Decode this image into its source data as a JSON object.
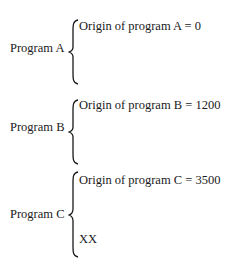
{
  "programs": [
    {
      "label": "Program A",
      "origin_text": "Origin of program A = 0",
      "extra": ""
    },
    {
      "label": "Program B",
      "origin_text": "Origin of program B = 1200",
      "extra": ""
    },
    {
      "label": "Program C",
      "origin_text": "Origin of program C = 3500",
      "extra": "XX"
    }
  ]
}
